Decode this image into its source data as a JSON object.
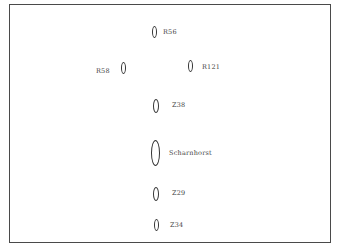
{
  "diagram": {
    "type": "naval formation",
    "ships": [
      {
        "id": "r56",
        "label": "R56",
        "size": "small"
      },
      {
        "id": "r58",
        "label": "R58",
        "size": "small"
      },
      {
        "id": "r121",
        "label": "R121",
        "size": "small"
      },
      {
        "id": "z38",
        "label": "Z38",
        "size": "medium"
      },
      {
        "id": "scharnhorst",
        "label": "Scharnhorst",
        "size": "large"
      },
      {
        "id": "z29",
        "label": "Z29",
        "size": "medium"
      },
      {
        "id": "z34",
        "label": "Z34",
        "size": "small"
      }
    ]
  }
}
